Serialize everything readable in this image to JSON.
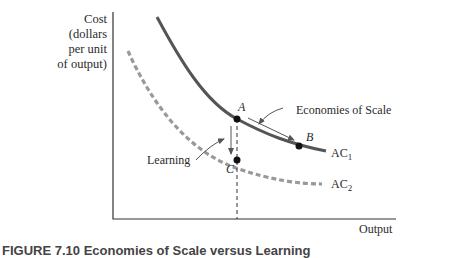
{
  "figure": {
    "caption": "FIGURE 7.10  Economies of Scale versus Learning",
    "y_axis_label": [
      "Cost",
      "(dollars",
      "per unit",
      "of output)"
    ],
    "x_axis_label": "Output",
    "curves": [
      {
        "name": "AC1",
        "base": "AC",
        "sub": "1",
        "style": "solid",
        "color": "#555555"
      },
      {
        "name": "AC2",
        "base": "AC",
        "sub": "2",
        "style": "dashed",
        "color": "#999999"
      }
    ],
    "points": [
      {
        "label": "A",
        "on": "AC1"
      },
      {
        "label": "B",
        "on": "AC1"
      },
      {
        "label": "C",
        "on": "AC2"
      }
    ],
    "annotations": {
      "economies": "Economies of Scale",
      "learning": "Learning"
    }
  }
}
